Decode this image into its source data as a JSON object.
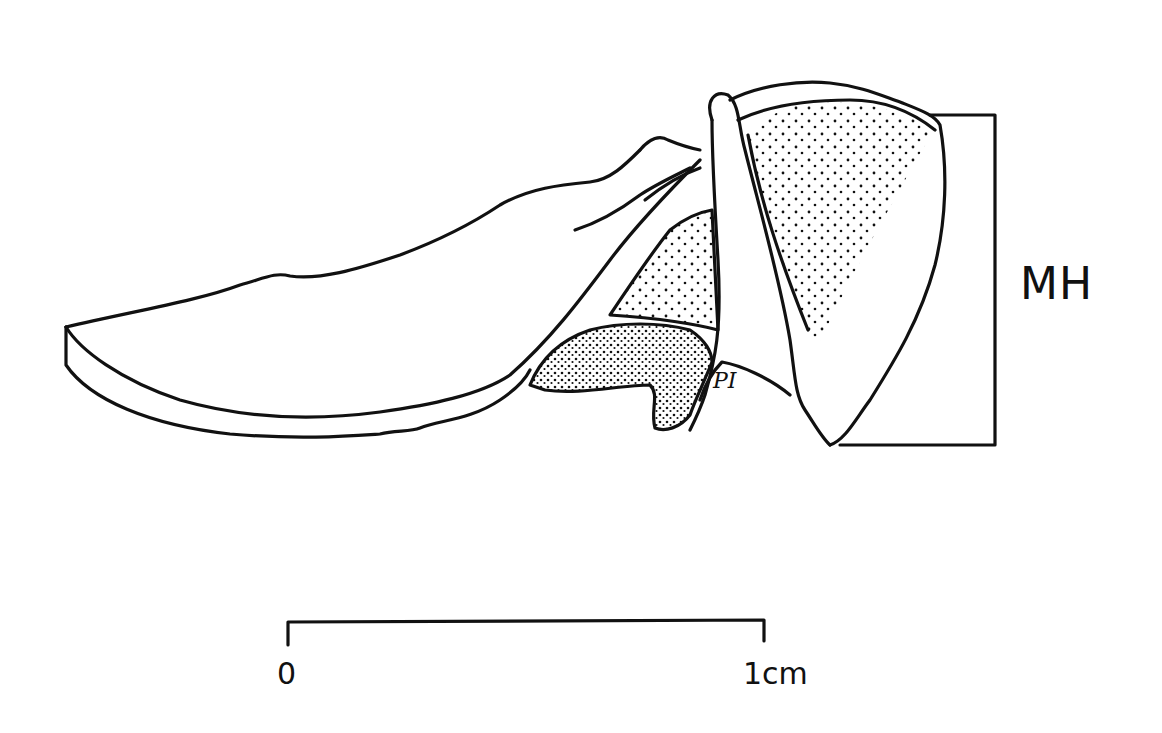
{
  "figure": {
    "type": "anatomical line drawing with stippling",
    "labels": {
      "mh": "MH",
      "pi": "PI"
    },
    "scale_bar": {
      "start_label": "0",
      "end_label": "1cm",
      "length_px": 476
    },
    "colors": {
      "ink": "#111111",
      "background": "#ffffff"
    }
  }
}
